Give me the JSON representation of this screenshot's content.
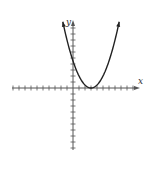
{
  "chart_data": {
    "type": "line",
    "title": "",
    "xlabel": "x",
    "ylabel": "y",
    "function": "y = 0.5(x - 3)^2",
    "vertex": [
      3,
      0
    ],
    "y_intercept": 4.5,
    "x": [
      -1.7,
      -1,
      0,
      1,
      2,
      3,
      4,
      5,
      6,
      7,
      7.7
    ],
    "values": [
      11.05,
      8,
      4.5,
      2,
      0.5,
      0,
      0.5,
      2,
      4.5,
      8,
      11.05
    ],
    "xlim": [
      -10,
      11
    ],
    "ylim": [
      -10,
      11
    ],
    "grid": false,
    "tick_interval": 1,
    "tick_labels": false,
    "curve_color": "#222222",
    "axis_color": "#555555"
  },
  "labels": {
    "x_axis": "x",
    "y_axis": "y"
  }
}
